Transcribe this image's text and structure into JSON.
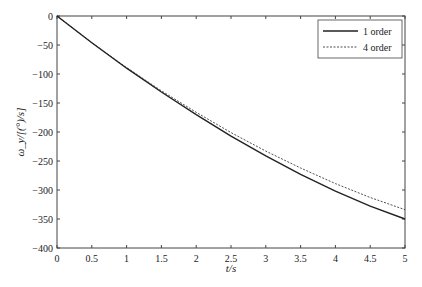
{
  "chart_data": {
    "type": "line",
    "title": "",
    "xlabel": "t/s",
    "ylabel": "ω_y/[(°)/s]",
    "xlim": [
      0,
      5
    ],
    "ylim": [
      -400,
      0
    ],
    "xticks": [
      "0",
      "0.5",
      "1",
      "1.5",
      "2",
      "2.5",
      "3",
      "3.5",
      "4",
      "4.5",
      "5"
    ],
    "yticks": [
      "0",
      "-50",
      "-100",
      "-150",
      "-200",
      "-250",
      "-300",
      "-350",
      "-400"
    ],
    "legend_position": "top-right",
    "grid": false,
    "x": [
      0,
      0.5,
      1,
      1.5,
      2,
      2.5,
      3,
      3.5,
      4,
      4.5,
      5
    ],
    "series": [
      {
        "name": "1 order",
        "style": "solid",
        "values": [
          0,
          -46,
          -90,
          -131,
          -170,
          -207,
          -241,
          -273,
          -302,
          -328,
          -350
        ]
      },
      {
        "name": "4 order",
        "style": "dashed",
        "values": [
          0,
          -46,
          -89,
          -129,
          -166,
          -201,
          -233,
          -262,
          -289,
          -313,
          -334
        ]
      }
    ]
  }
}
